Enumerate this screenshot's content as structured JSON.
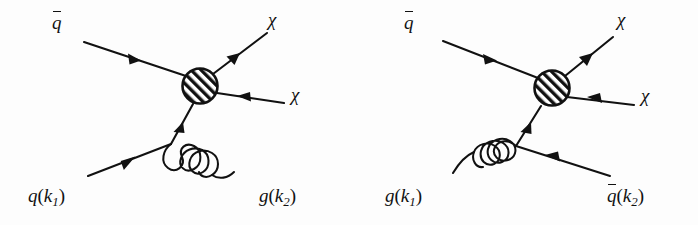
{
  "figure": {
    "background_color": "#fdfdfd",
    "line_color": "#111111",
    "blob_fill": "#ffffff",
    "blob_hatch_color": "#111111",
    "width": 698,
    "height": 225,
    "panel_count": 2
  },
  "diagrams": [
    {
      "id": "diagram-left",
      "name": "quark-antiquark-annihilation-with-gluon-emission",
      "process": "q qbar -> chi chi + g",
      "blob": {
        "name": "effective-vertex-blob",
        "cx": 200,
        "cy": 86,
        "r": 18,
        "hatch": "diagonal",
        "hatch_direction": "up-right"
      },
      "legs": [
        {
          "name": "incoming-antiquark-leg",
          "label": "q̄",
          "label_kind": "overbar",
          "label_text": "q",
          "label_x": 52,
          "label_y": 12,
          "arrow": "toward-upper-left",
          "line_kind": "fermion"
        },
        {
          "name": "outgoing-chi-upper-leg",
          "label": "χ",
          "label_kind": "plain",
          "label_text": "χ",
          "label_x": 268,
          "label_y": 10,
          "arrow": "toward-upper-right",
          "line_kind": "fermion"
        },
        {
          "name": "outgoing-chi-lower-leg",
          "label": "χ",
          "label_kind": "plain",
          "label_text": "χ",
          "label_x": 291,
          "label_y": 85,
          "arrow": "toward-blob",
          "line_kind": "fermion"
        },
        {
          "name": "incoming-quark-leg",
          "label": "q(k₁)",
          "label_kind": "momentum",
          "label_base": "q",
          "label_momentum": "k",
          "label_index": "1",
          "label_x": 28,
          "label_y": 186,
          "arrow": "toward-upper-right",
          "line_kind": "fermion"
        },
        {
          "name": "outgoing-gluon-leg",
          "label": "g(k₂)",
          "label_kind": "momentum",
          "label_base": "g",
          "label_momentum": "k",
          "label_index": "2",
          "label_x": 259,
          "label_y": 186,
          "arrow": "none",
          "line_kind": "gluon",
          "coils": 4
        },
        {
          "name": "internal-quark-propagator",
          "label": "",
          "label_kind": "none",
          "arrow": "toward-blob",
          "line_kind": "fermion"
        }
      ]
    },
    {
      "id": "diagram-right",
      "name": "gluon-antiquark-compton-scattering",
      "process": "g qbar -> chi chi + qbar",
      "blob": {
        "name": "effective-vertex-blob",
        "cx": 552,
        "cy": 88,
        "r": 18,
        "hatch": "diagonal",
        "hatch_direction": "up-right"
      },
      "legs": [
        {
          "name": "incoming-antiquark-leg",
          "label": "q̄",
          "label_kind": "overbar",
          "label_text": "q",
          "label_x": 404,
          "label_y": 12,
          "arrow": "toward-upper-left",
          "line_kind": "fermion"
        },
        {
          "name": "outgoing-chi-upper-leg",
          "label": "χ",
          "label_kind": "plain",
          "label_text": "χ",
          "label_x": 617,
          "label_y": 10,
          "arrow": "toward-upper-right",
          "line_kind": "fermion"
        },
        {
          "name": "outgoing-chi-lower-leg",
          "label": "χ",
          "label_kind": "plain",
          "label_text": "χ",
          "label_x": 641,
          "label_y": 86,
          "arrow": "toward-blob",
          "line_kind": "fermion"
        },
        {
          "name": "incoming-gluon-leg",
          "label": "g(k₁)",
          "label_kind": "momentum",
          "label_base": "g",
          "label_momentum": "k",
          "label_index": "1",
          "label_x": 385,
          "label_y": 186,
          "arrow": "none",
          "line_kind": "gluon",
          "coils": 4
        },
        {
          "name": "outgoing-antiquark-leg",
          "label": "q̄(k₂)",
          "label_kind": "overbar-momentum",
          "label_base": "q",
          "label_momentum": "k",
          "label_index": "2",
          "label_x": 607,
          "label_y": 185,
          "arrow": "toward-vertex",
          "line_kind": "fermion"
        },
        {
          "name": "internal-quark-propagator",
          "label": "",
          "label_kind": "none",
          "arrow": "toward-blob",
          "line_kind": "fermion"
        }
      ]
    }
  ]
}
